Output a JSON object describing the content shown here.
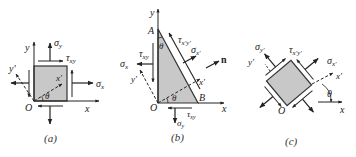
{
  "figures": [
    {
      "id": "a",
      "caption": "(a)",
      "labels": {
        "y_axis": "y",
        "x_axis": "x",
        "y_prime": "y'",
        "x_prime": "x'",
        "origin": "O",
        "theta": "θ",
        "sigma_y": "σ",
        "sigma_y_sub": "y",
        "sigma_x": "σ",
        "sigma_x_sub": "x",
        "tau_xy": "τ",
        "tau_xy_sub": "xy"
      }
    },
    {
      "id": "b",
      "caption": "(b)",
      "labels": {
        "y_axis": "y",
        "x_axis": "x",
        "vertex_a": "A",
        "vertex_b": "B",
        "origin": "O",
        "theta_top": "θ",
        "theta_bottom": "θ",
        "y_prime": "y'",
        "x_prime": "x'",
        "normal": "n",
        "tau_xpyp": "τ",
        "tau_xpyp_sub": "x'y'",
        "sigma_xp": "σ",
        "sigma_xp_sub": "x'",
        "tau_xy_left": "τ",
        "tau_xy_left_sub": "xy",
        "sigma_x": "σ",
        "sigma_x_sub": "x",
        "tau_xy_bottom": "τ",
        "tau_xy_bottom_sub": "xy",
        "sigma_y": "σ",
        "sigma_y_sub": "y"
      }
    },
    {
      "id": "c",
      "caption": "(c)",
      "labels": {
        "sigma_yp": "σ",
        "sigma_yp_sub": "y'",
        "tau_xpyp": "τ",
        "tau_xpyp_sub": "x'y'",
        "sigma_xp": "σ",
        "sigma_xp_sub": "x'",
        "y_prime": "y'",
        "x_prime": "x'",
        "theta": "θ",
        "origin": "O",
        "x_axis": "x"
      }
    }
  ],
  "colors": {
    "fill": "#c8c8c8",
    "stroke": "#222222",
    "background": "#ffffff"
  }
}
